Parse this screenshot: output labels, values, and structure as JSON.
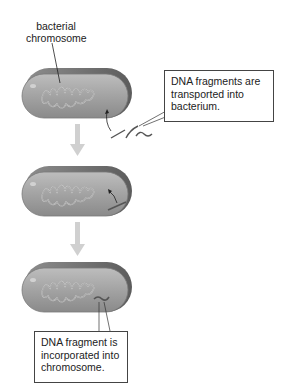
{
  "diagram": {
    "labels": {
      "chromosome": "bacterial chromosome",
      "step1_callout": "DNA fragments are transported into bacterium.",
      "step3_callout": "DNA fragment is incorporated into chromosome."
    },
    "stages": [
      {
        "id": "stage-1",
        "description": "bacterium with free DNA fragments outside"
      },
      {
        "id": "stage-2",
        "description": "DNA fragment inside bacterium"
      },
      {
        "id": "stage-3",
        "description": "DNA fragment incorporated into chromosome"
      }
    ],
    "colors": {
      "cell_fill": "#9a9a9a",
      "cell_top": "#6e6e6e",
      "arrow": "#cfcfcf",
      "dna_fragment": "#5a5a5a"
    }
  }
}
